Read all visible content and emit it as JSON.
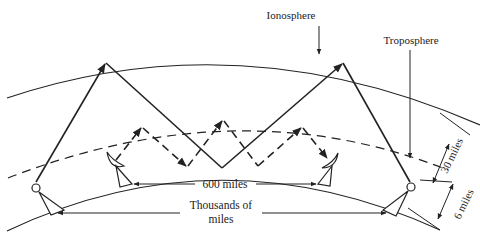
{
  "diagram": {
    "labels": {
      "ionosphere": "Ionosphere",
      "troposphere": "Troposphere",
      "short_range": "600 miles",
      "long_range_line1": "Thousands of",
      "long_range_line2": "miles",
      "height_30": "30 miles",
      "height_6": "6 miles"
    },
    "layers": [
      {
        "name": "ionosphere",
        "style": "solid"
      },
      {
        "name": "troposphere",
        "style": "dashed"
      },
      {
        "name": "earth-surface",
        "style": "solid"
      }
    ],
    "paths": [
      {
        "name": "ionospheric-path",
        "style": "solid",
        "hops": 2
      },
      {
        "name": "tropospheric-path",
        "style": "dashed",
        "hops": 3
      }
    ],
    "colors": {
      "line": "#222222",
      "background": "#ffffff"
    }
  }
}
